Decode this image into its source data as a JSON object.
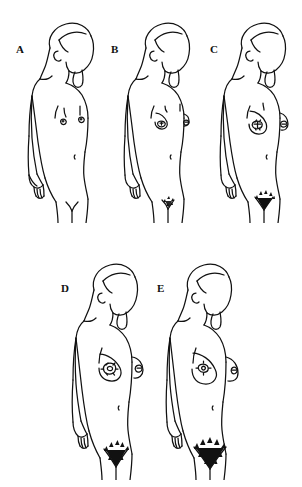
{
  "figure": {
    "background_color": "#ffffff",
    "ink_color": "#111111",
    "caption_remnant": "",
    "panels": [
      {
        "id": "A",
        "label": "A",
        "stage_name": "Stage 1",
        "breast_description": "Prepubertal: flat chest, small papilla elevation only",
        "pubic_hair_description": "No pubic hair",
        "pubic_hair_density": 0,
        "breast_size": 0,
        "label_x": 16,
        "label_y": 44,
        "fig_x": 14,
        "fig_y": 18,
        "fig_w": 92,
        "fig_h": 205
      },
      {
        "id": "B",
        "label": "B",
        "stage_name": "Stage 2",
        "breast_description": "Breast bud: small mound, areola widens",
        "pubic_hair_description": "Sparse, lightly pigmented hair along labia",
        "pubic_hair_density": 1,
        "breast_size": 1,
        "label_x": 113,
        "label_y": 46,
        "fig_x": 110,
        "fig_y": 18,
        "fig_w": 92,
        "fig_h": 205
      },
      {
        "id": "C",
        "label": "C",
        "stage_name": "Stage 3",
        "breast_description": "Breast and areola enlarge, no contour separation",
        "pubic_hair_description": "Darker, coarser, curlier hair spreading over pubes",
        "pubic_hair_density": 2,
        "breast_size": 2,
        "label_x": 214,
        "label_y": 46,
        "fig_x": 206,
        "fig_y": 18,
        "fig_w": 92,
        "fig_h": 205
      },
      {
        "id": "D",
        "label": "D",
        "stage_name": "Stage 4",
        "breast_description": "Areola and papilla form a secondary mound",
        "pubic_hair_description": "Adult-type hair, smaller area, no spread to thighs",
        "pubic_hair_density": 3,
        "breast_size": 3,
        "label_x": 62,
        "label_y": 285,
        "fig_x": 58,
        "fig_y": 258,
        "fig_w": 92,
        "fig_h": 222
      },
      {
        "id": "E",
        "label": "E",
        "stage_name": "Stage 5",
        "breast_description": "Mature breast, areola recedes to general breast contour",
        "pubic_hair_description": "Adult quantity and distribution, inverse triangle",
        "pubic_hair_density": 4,
        "breast_size": 4,
        "label_x": 157,
        "label_y": 285,
        "fig_x": 152,
        "fig_y": 258,
        "fig_w": 92,
        "fig_h": 222
      }
    ]
  }
}
